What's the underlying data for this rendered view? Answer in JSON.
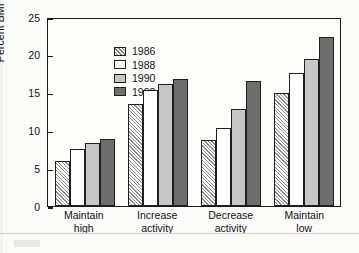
{
  "chart_data": {
    "type": "bar",
    "title": "",
    "xlabel": "",
    "ylabel": "Percent BMI > 27.8 kg/m2",
    "ylabel_prefix": "Percent BMI > 27.8 kg/m",
    "ylabel_exponent": "2",
    "ylim": [
      0,
      25
    ],
    "yticks": [
      0,
      5,
      10,
      15,
      20,
      25
    ],
    "ytick_labels": [
      "0",
      "5",
      "10",
      "15",
      "20",
      "25"
    ],
    "grid": false,
    "legend_position": "top-left",
    "categories": [
      "Maintain high",
      "Increase activity",
      "Decrease activity",
      "Maintain low"
    ],
    "category_lines": [
      [
        "Maintain",
        "high"
      ],
      [
        "Increase",
        "activity"
      ],
      [
        "Decrease",
        "activity"
      ],
      [
        "Maintain",
        "low"
      ]
    ],
    "series": [
      {
        "name": "1986",
        "fill": "hatched",
        "color": "#ffffff",
        "values": [
          5.9,
          13.5,
          8.7,
          15.0
        ]
      },
      {
        "name": "1988",
        "fill": "solid",
        "color": "#ffffff",
        "values": [
          7.5,
          15.3,
          10.3,
          17.6
        ]
      },
      {
        "name": "1990",
        "fill": "solid",
        "color": "#c7c7c7",
        "values": [
          8.3,
          16.2,
          12.8,
          19.5
        ]
      },
      {
        "name": "1992",
        "fill": "solid",
        "color": "#6e6e6e",
        "values": [
          8.8,
          16.8,
          16.5,
          22.4
        ]
      }
    ]
  },
  "colors": {
    "axis": "#1a1a1a",
    "background": "#fbfbf9",
    "plot_background": "#fdfdfb",
    "series_1986": "#ffffff",
    "series_1988": "#ffffff",
    "series_1990": "#c7c7c7",
    "series_1992": "#6e6e6e"
  }
}
